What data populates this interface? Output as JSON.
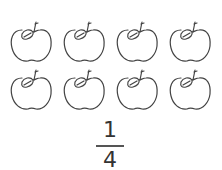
{
  "apples": {
    "count": 8,
    "rows": 2,
    "per_row": 4,
    "stroke_color": "#444444"
  },
  "fraction": {
    "numerator": "1",
    "denominator": "4"
  }
}
